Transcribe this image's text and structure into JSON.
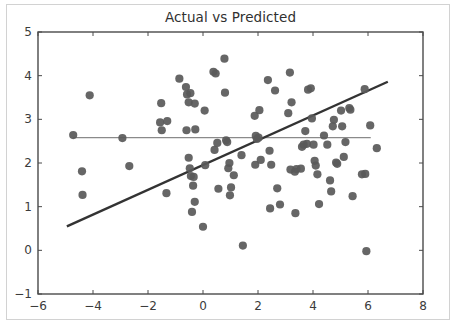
{
  "chart_data": {
    "type": "scatter",
    "title": "Actual vs Predicted",
    "xlabel": "",
    "ylabel": "",
    "xlim": [
      -6,
      8
    ],
    "ylim": [
      -1,
      5
    ],
    "xticks": [
      -6,
      -4,
      -2,
      0,
      2,
      4,
      6,
      8
    ],
    "xtick_labels": [
      "−6",
      "−4",
      "−2",
      "0",
      "2",
      "4",
      "6",
      "8"
    ],
    "yticks": [
      -1,
      0,
      1,
      2,
      3,
      4,
      5
    ],
    "ytick_labels": [
      "−1",
      "0",
      "1",
      "2",
      "3",
      "4",
      "5"
    ],
    "grid": false,
    "legend": null,
    "marker_color": "#595959",
    "marker_size": 7,
    "points": [
      [
        -4.72,
        2.64
      ],
      [
        -4.4,
        1.81
      ],
      [
        -4.38,
        1.27
      ],
      [
        -4.12,
        3.55
      ],
      [
        -2.93,
        2.57
      ],
      [
        -2.68,
        1.93
      ],
      [
        -1.52,
        3.37
      ],
      [
        -1.56,
        2.93
      ],
      [
        -1.5,
        2.75
      ],
      [
        -1.3,
        2.96
      ],
      [
        -1.33,
        1.31
      ],
      [
        -0.86,
        3.93
      ],
      [
        -0.62,
        3.74
      ],
      [
        -0.58,
        3.57
      ],
      [
        -0.46,
        3.6
      ],
      [
        -0.52,
        3.39
      ],
      [
        -0.6,
        2.75
      ],
      [
        -0.3,
        3.36
      ],
      [
        -0.28,
        2.77
      ],
      [
        -0.52,
        2.12
      ],
      [
        -0.48,
        1.88
      ],
      [
        -0.44,
        1.7
      ],
      [
        -0.34,
        1.68
      ],
      [
        -0.36,
        1.48
      ],
      [
        -0.3,
        1.11
      ],
      [
        -0.4,
        0.88
      ],
      [
        0.06,
        3.2
      ],
      [
        0.08,
        1.95
      ],
      [
        0.0,
        0.54
      ],
      [
        0.38,
        4.09
      ],
      [
        0.46,
        4.05
      ],
      [
        0.42,
        2.3
      ],
      [
        0.52,
        2.46
      ],
      [
        0.56,
        1.41
      ],
      [
        0.78,
        4.39
      ],
      [
        0.8,
        3.61
      ],
      [
        0.84,
        2.52
      ],
      [
        0.88,
        2.48
      ],
      [
        0.92,
        1.88
      ],
      [
        0.96,
        2.0
      ],
      [
        0.98,
        1.26
      ],
      [
        1.02,
        1.44
      ],
      [
        1.12,
        1.72
      ],
      [
        1.45,
        0.11
      ],
      [
        1.4,
        2.18
      ],
      [
        1.92,
        2.62
      ],
      [
        1.96,
        2.55
      ],
      [
        2.02,
        2.58
      ],
      [
        1.88,
        3.08
      ],
      [
        2.05,
        3.21
      ],
      [
        1.9,
        1.96
      ],
      [
        2.1,
        2.07
      ],
      [
        2.36,
        3.9
      ],
      [
        2.42,
        2.28
      ],
      [
        2.48,
        1.96
      ],
      [
        2.44,
        0.96
      ],
      [
        2.62,
        3.66
      ],
      [
        2.7,
        1.42
      ],
      [
        2.8,
        1.05
      ],
      [
        3.1,
        3.14
      ],
      [
        3.16,
        4.07
      ],
      [
        3.22,
        3.39
      ],
      [
        3.18,
        1.85
      ],
      [
        3.34,
        1.8
      ],
      [
        3.4,
        1.86
      ],
      [
        3.36,
        0.85
      ],
      [
        3.56,
        1.87
      ],
      [
        3.6,
        2.37
      ],
      [
        3.66,
        2.42
      ],
      [
        3.72,
        2.73
      ],
      [
        3.78,
        2.44
      ],
      [
        3.82,
        3.68
      ],
      [
        3.92,
        3.71
      ],
      [
        3.96,
        3.02
      ],
      [
        4.02,
        2.42
      ],
      [
        4.06,
        2.05
      ],
      [
        4.1,
        1.94
      ],
      [
        4.16,
        1.74
      ],
      [
        4.22,
        1.06
      ],
      [
        4.4,
        2.63
      ],
      [
        4.52,
        2.42
      ],
      [
        4.62,
        1.6
      ],
      [
        4.66,
        1.35
      ],
      [
        4.72,
        2.84
      ],
      [
        4.76,
        2.99
      ],
      [
        4.84,
        2.01
      ],
      [
        4.88,
        1.98
      ],
      [
        5.02,
        3.2
      ],
      [
        5.06,
        2.84
      ],
      [
        5.12,
        2.14
      ],
      [
        5.18,
        2.48
      ],
      [
        5.32,
        3.26
      ],
      [
        5.36,
        3.22
      ],
      [
        5.44,
        1.24
      ],
      [
        5.78,
        1.74
      ],
      [
        5.9,
        1.75
      ],
      [
        5.88,
        3.69
      ],
      [
        5.94,
        -0.02
      ],
      [
        6.08,
        2.86
      ],
      [
        6.32,
        2.34
      ]
    ],
    "fit_line": {
      "name": "regression-line",
      "color": "#333333",
      "width": 2.4,
      "x0": -4.95,
      "y0": 0.55,
      "x1": 6.72,
      "y1": 3.86
    },
    "mean_line": {
      "name": "mean-line",
      "color": "#8a8a8a",
      "width": 1.3,
      "x0": -4.72,
      "y0": 2.58,
      "x1": 6.1,
      "y1": 2.58
    }
  }
}
